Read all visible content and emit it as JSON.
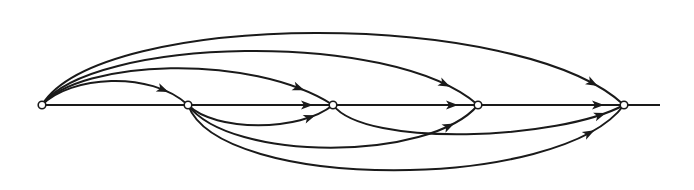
{
  "diagram": {
    "type": "directed-graph",
    "nodes": [
      {
        "id": "n1"
      },
      {
        "id": "n2"
      },
      {
        "id": "n3"
      },
      {
        "id": "n4"
      },
      {
        "id": "n5"
      }
    ],
    "edges": [
      {
        "from": "n1",
        "to": "n2",
        "side": "above"
      },
      {
        "from": "n1",
        "to": "n3",
        "side": "above"
      },
      {
        "from": "n1",
        "to": "n4",
        "side": "above"
      },
      {
        "from": "n1",
        "to": "n5",
        "side": "above"
      },
      {
        "from": "n1",
        "to": "n2",
        "side": "line"
      },
      {
        "from": "n2",
        "to": "n3",
        "side": "line"
      },
      {
        "from": "n3",
        "to": "n4",
        "side": "line"
      },
      {
        "from": "n4",
        "to": "n5",
        "side": "line"
      },
      {
        "from": "n2",
        "to": "n3",
        "side": "below"
      },
      {
        "from": "n2",
        "to": "n4",
        "side": "below"
      },
      {
        "from": "n2",
        "to": "n5",
        "side": "below"
      },
      {
        "from": "n3",
        "to": "n5",
        "side": "below"
      }
    ],
    "colors": {
      "stroke": "#1a1a1a",
      "background": "#ffffff",
      "node_fill": "#ffffff"
    }
  }
}
